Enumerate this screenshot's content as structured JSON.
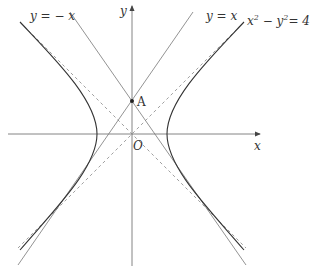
{
  "diagram": {
    "type": "hyperbola-plot",
    "equation_label": "x² − y² = 4",
    "equation_parts": {
      "x": "x",
      "y": "y",
      "exp": "2",
      "rest": "= 4",
      "minus": " − "
    },
    "line_label_neg": "y = − x",
    "line_label_pos": "y = x",
    "axis_x_label": "x",
    "axis_y_label": "y",
    "point_A_label": "A",
    "origin_label": "O",
    "colors": {
      "axis": "#555555",
      "curve": "#333333",
      "line": "#666666",
      "asymptote": "#888888"
    }
  }
}
